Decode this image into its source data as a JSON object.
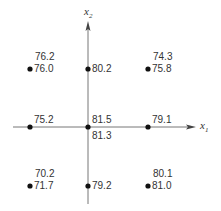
{
  "diagram": {
    "axes": {
      "x": {
        "name": "x",
        "subscript": "1"
      },
      "y": {
        "name": "x",
        "subscript": "2"
      }
    },
    "design_points": [
      {
        "id": "top-left",
        "x1": -1,
        "x2": 1,
        "values": [
          "76.2",
          "76.0"
        ]
      },
      {
        "id": "top-center",
        "x1": 0,
        "x2": 1,
        "values": [
          "80.2"
        ]
      },
      {
        "id": "top-right",
        "x1": 1,
        "x2": 1,
        "values": [
          "74.3",
          "75.8"
        ]
      },
      {
        "id": "mid-left",
        "x1": -1,
        "x2": 0,
        "values": [
          "75.2"
        ]
      },
      {
        "id": "center",
        "x1": 0,
        "x2": 0,
        "values": [
          "81.5",
          "81.3"
        ]
      },
      {
        "id": "mid-right",
        "x1": 1,
        "x2": 0,
        "values": [
          "79.1"
        ]
      },
      {
        "id": "bottom-left",
        "x1": -1,
        "x2": -1,
        "values": [
          "70.2",
          "71.7"
        ]
      },
      {
        "id": "bottom-center",
        "x1": 0,
        "x2": -1,
        "values": [
          "79.2"
        ]
      },
      {
        "id": "bottom-right",
        "x1": 1,
        "x2": -1,
        "values": [
          "80.1",
          "81.0"
        ]
      }
    ],
    "colors": {
      "ink": "#333333",
      "axis": "#777777"
    }
  }
}
